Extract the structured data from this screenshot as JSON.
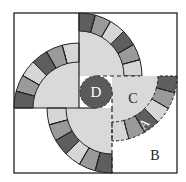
{
  "diagram": {
    "frame": {
      "x": 14,
      "y": 13,
      "width": 163,
      "height": 160
    },
    "colors": {
      "background": "#ffffff",
      "stroke": "#222222",
      "disc_fill": "#d9d9d9",
      "tile_light": "#d6d6d6",
      "tile_medium": "#9a9a9a",
      "tile_dark": "#5e5e5e",
      "center_circle": "#5a5a5a",
      "center_label": "#ffffff"
    },
    "center_circle": {
      "cx": 96,
      "cy": 92,
      "r": 16,
      "label": "D"
    },
    "labels": {
      "A": "A",
      "B": "B",
      "C": "C",
      "D": "D"
    },
    "quadrants": [
      {
        "name": "top-right",
        "cx": 79,
        "cy": 76,
        "r_out": 63,
        "r_in": 45,
        "start_deg": -90,
        "end_deg": 0,
        "dashed_arc": false,
        "tiles": [
          "dark",
          "medium",
          "light",
          "dark",
          "medium",
          "light"
        ]
      },
      {
        "name": "top-left",
        "cx": 79,
        "cy": 108,
        "r_out": 65,
        "r_in": 46,
        "start_deg": -90,
        "end_deg": -180,
        "dashed_arc": false,
        "tiles": [
          "light",
          "medium",
          "dark",
          "light",
          "medium",
          "dark"
        ]
      },
      {
        "name": "bottom",
        "cx": 112,
        "cy": 108,
        "r_out": 65,
        "r_in": 46,
        "start_deg": 180,
        "end_deg": 90,
        "dashed_arc": false,
        "tiles": [
          "light",
          "medium",
          "dark",
          "light",
          "medium",
          "dark"
        ]
      },
      {
        "name": "right",
        "cx": 112,
        "cy": 76,
        "r_out": 65,
        "r_in": 46,
        "start_deg": 0,
        "end_deg": 90,
        "dashed_arc": true,
        "tiles": [
          "dark",
          "medium",
          "light",
          "dark",
          "medium",
          "light"
        ]
      }
    ]
  }
}
